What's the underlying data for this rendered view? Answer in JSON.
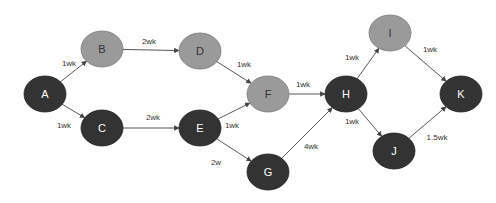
{
  "diagram": {
    "type": "network-diagram",
    "colors": {
      "critical": "#333333",
      "noncritical": "#9a9a9a",
      "edge": "#444444",
      "background": "#ffffff"
    },
    "nodes": [
      {
        "id": "A",
        "label": "A",
        "x": 45,
        "y": 94,
        "critical": true
      },
      {
        "id": "B",
        "label": "B",
        "x": 102,
        "y": 49,
        "critical": false
      },
      {
        "id": "C",
        "label": "C",
        "x": 102,
        "y": 128,
        "critical": true
      },
      {
        "id": "D",
        "label": "D",
        "x": 200,
        "y": 51,
        "critical": false
      },
      {
        "id": "E",
        "label": "E",
        "x": 200,
        "y": 128,
        "critical": true
      },
      {
        "id": "F",
        "label": "F",
        "x": 268,
        "y": 94,
        "critical": false
      },
      {
        "id": "G",
        "label": "G",
        "x": 268,
        "y": 172,
        "critical": true
      },
      {
        "id": "H",
        "label": "H",
        "x": 346,
        "y": 94,
        "critical": true
      },
      {
        "id": "I",
        "label": "I",
        "x": 390,
        "y": 33,
        "critical": false
      },
      {
        "id": "J",
        "label": "J",
        "x": 394,
        "y": 151,
        "critical": true
      },
      {
        "id": "K",
        "label": "K",
        "x": 461,
        "y": 94,
        "critical": true
      }
    ],
    "edges": [
      {
        "from": "A",
        "to": "B",
        "label": "1wk",
        "lx": 69,
        "ly": 66
      },
      {
        "from": "A",
        "to": "C",
        "label": "1wk",
        "lx": 64,
        "ly": 128
      },
      {
        "from": "B",
        "to": "D",
        "label": "2wk",
        "lx": 149,
        "ly": 44
      },
      {
        "from": "C",
        "to": "E",
        "label": "2wk",
        "lx": 153,
        "ly": 120
      },
      {
        "from": "D",
        "to": "F",
        "label": "1wk",
        "lx": 244,
        "ly": 67
      },
      {
        "from": "E",
        "to": "F",
        "label": "1wk",
        "lx": 232,
        "ly": 128
      },
      {
        "from": "E",
        "to": "G",
        "label": "2w",
        "lx": 216,
        "ly": 165
      },
      {
        "from": "F",
        "to": "H",
        "label": "1wk",
        "lx": 303,
        "ly": 87
      },
      {
        "from": "G",
        "to": "H",
        "label": "4wk",
        "lx": 311,
        "ly": 149
      },
      {
        "from": "H",
        "to": "I",
        "label": "1wk",
        "lx": 352,
        "ly": 60
      },
      {
        "from": "H",
        "to": "J",
        "label": "1wk",
        "lx": 352,
        "ly": 124
      },
      {
        "from": "I",
        "to": "K",
        "label": "1wk",
        "lx": 430,
        "ly": 52
      },
      {
        "from": "J",
        "to": "K",
        "label": "1.5wk",
        "lx": 437,
        "ly": 140
      }
    ]
  }
}
